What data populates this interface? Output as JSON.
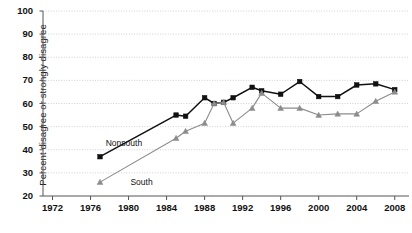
{
  "chart_data": {
    "type": "line",
    "title": "",
    "xlabel": "",
    "ylabel": "Percent disagree or strongly disagree",
    "xlim": [
      1971,
      2009.5
    ],
    "ylim": [
      20,
      100
    ],
    "yticks": [
      20,
      30,
      40,
      50,
      60,
      70,
      80,
      90,
      100
    ],
    "xticks": [
      1972,
      1976,
      1980,
      1984,
      1988,
      1992,
      1996,
      2000,
      2004,
      2008
    ],
    "grid": true,
    "legend_position": "inline-annotation",
    "series": [
      {
        "name": "Nonsouth",
        "marker": "square",
        "color": "#111111",
        "points": [
          {
            "x": 1977,
            "y": 37
          },
          {
            "x": 1985,
            "y": 55
          },
          {
            "x": 1986,
            "y": 54.5
          },
          {
            "x": 1988,
            "y": 62.5
          },
          {
            "x": 1989,
            "y": 60
          },
          {
            "x": 1990,
            "y": 60.5
          },
          {
            "x": 1991,
            "y": 62.5
          },
          {
            "x": 1993,
            "y": 67
          },
          {
            "x": 1994,
            "y": 65.5
          },
          {
            "x": 1996,
            "y": 64
          },
          {
            "x": 1998,
            "y": 69.5
          },
          {
            "x": 2000,
            "y": 63
          },
          {
            "x": 2002,
            "y": 63
          },
          {
            "x": 2004,
            "y": 68
          },
          {
            "x": 2006,
            "y": 68.5
          },
          {
            "x": 2008,
            "y": 66
          }
        ]
      },
      {
        "name": "South",
        "marker": "triangle",
        "color": "#8c8c8c",
        "points": [
          {
            "x": 1977,
            "y": 26
          },
          {
            "x": 1985,
            "y": 45
          },
          {
            "x": 1986,
            "y": 48
          },
          {
            "x": 1988,
            "y": 51.5
          },
          {
            "x": 1989,
            "y": 60
          },
          {
            "x": 1990,
            "y": 60.5
          },
          {
            "x": 1991,
            "y": 51.5
          },
          {
            "x": 1993,
            "y": 58
          },
          {
            "x": 1994,
            "y": 64.5
          },
          {
            "x": 1996,
            "y": 58
          },
          {
            "x": 1998,
            "y": 58
          },
          {
            "x": 2000,
            "y": 55
          },
          {
            "x": 2002,
            "y": 55.5
          },
          {
            "x": 2004,
            "y": 55.5
          },
          {
            "x": 2006,
            "y": 61
          },
          {
            "x": 2008,
            "y": 65
          }
        ]
      }
    ],
    "annotations": [
      {
        "text": "Nonsouth",
        "x": 1977.6,
        "y": 42.5
      },
      {
        "text": "South",
        "x": 1980.2,
        "y": 25.5
      }
    ]
  }
}
